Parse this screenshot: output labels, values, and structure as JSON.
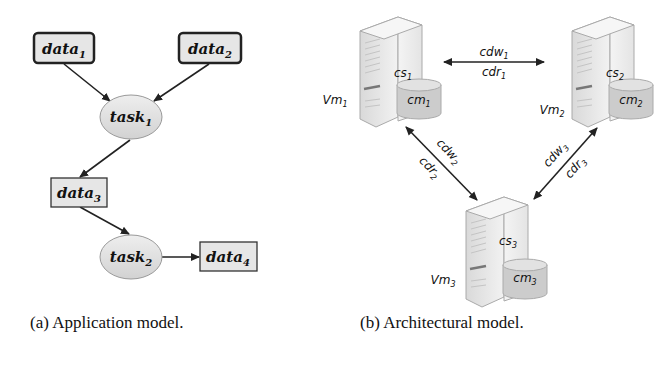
{
  "figure": {
    "subfigure_a": {
      "caption": "(a) Application model.",
      "nodes": [
        {
          "id": "data1",
          "type": "data",
          "label": "data",
          "sub": "1",
          "emphasized": true
        },
        {
          "id": "data2",
          "type": "data",
          "label": "data",
          "sub": "2",
          "emphasized": true
        },
        {
          "id": "task1",
          "type": "task",
          "label": "task",
          "sub": "1"
        },
        {
          "id": "data3",
          "type": "data",
          "label": "data",
          "sub": "3"
        },
        {
          "id": "task2",
          "type": "task",
          "label": "task",
          "sub": "2"
        },
        {
          "id": "data4",
          "type": "data",
          "label": "data",
          "sub": "4"
        }
      ],
      "edges": [
        {
          "from": "data1",
          "to": "task1"
        },
        {
          "from": "data2",
          "to": "task1"
        },
        {
          "from": "task1",
          "to": "data3"
        },
        {
          "from": "data3",
          "to": "task2"
        },
        {
          "from": "task2",
          "to": "data4"
        }
      ]
    },
    "subfigure_b": {
      "caption": "(b) Architectural model.",
      "vms": [
        {
          "label": "Vm",
          "sub": "1",
          "server": "cs",
          "server_sub": "1",
          "storage": "cm",
          "storage_sub": "1"
        },
        {
          "label": "Vm",
          "sub": "2",
          "server": "cs",
          "server_sub": "2",
          "storage": "cm",
          "storage_sub": "2"
        },
        {
          "label": "Vm",
          "sub": "3",
          "server": "cs",
          "server_sub": "3",
          "storage": "cm",
          "storage_sub": "3"
        }
      ],
      "links": [
        {
          "between": [
            "Vm1",
            "Vm2"
          ],
          "write": "cdw",
          "write_sub": "1",
          "read": "cdr",
          "read_sub": "1"
        },
        {
          "between": [
            "Vm1",
            "Vm3"
          ],
          "write": "cdw",
          "write_sub": "2",
          "read": "cdr",
          "read_sub": "2"
        },
        {
          "between": [
            "Vm2",
            "Vm3"
          ],
          "write": "cdw",
          "write_sub": "3",
          "read": "cdr",
          "read_sub": "3"
        }
      ]
    }
  },
  "colors": {
    "node_fill": "#e6e6e6",
    "stroke": "#222222",
    "server_fill": "#ececec",
    "storage_fill": "#cfcfcf"
  }
}
